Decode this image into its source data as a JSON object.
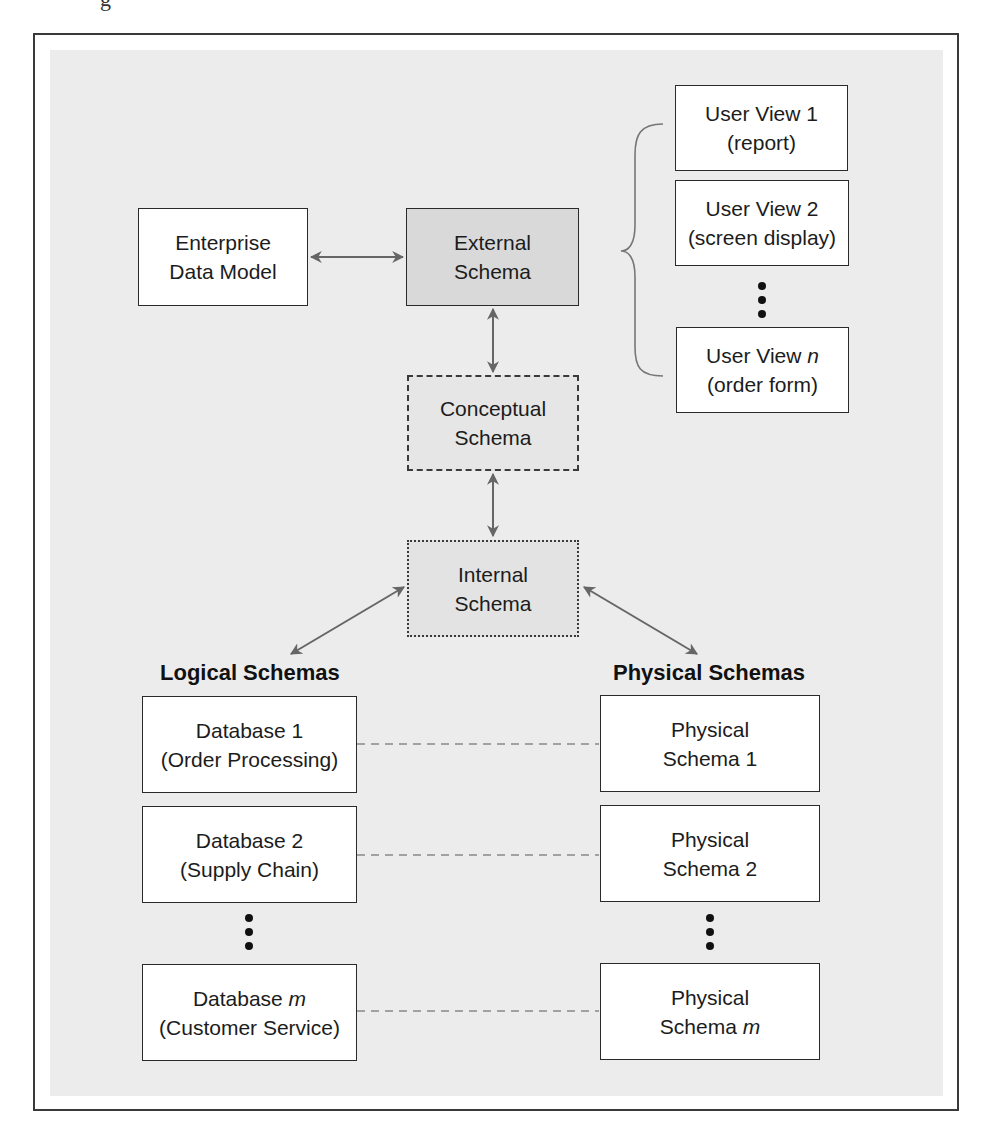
{
  "page_fragment": "g",
  "colors": {
    "frame": "#3a3a3a",
    "panel": "#ececec",
    "box_fill": "#ffffff",
    "external_fill": "#d9d9d9",
    "arrow": "#666666"
  },
  "top": {
    "enterprise": {
      "line1": "Enterprise",
      "line2": "Data Model"
    },
    "external": {
      "line1": "External",
      "line2": "Schema"
    },
    "conceptual": {
      "line1": "Conceptual",
      "line2": "Schema"
    },
    "internal": {
      "line1": "Internal",
      "line2": "Schema"
    }
  },
  "user_views": [
    {
      "line1": "User View 1",
      "line2": "(report)"
    },
    {
      "line1": "User View 2",
      "line2": "(screen display)"
    },
    {
      "line1_prefix": "User View ",
      "line1_var": "n",
      "line2": "(order form)"
    }
  ],
  "logical": {
    "heading": "Logical Schemas",
    "items": [
      {
        "line1": "Database 1",
        "line2": "(Order Processing)"
      },
      {
        "line1": "Database 2",
        "line2": "(Supply Chain)"
      },
      {
        "line1_prefix": "Database ",
        "line1_var": "m",
        "line2": "(Customer Service)"
      }
    ]
  },
  "physical": {
    "heading": "Physical Schemas",
    "items": [
      {
        "line1": "Physical",
        "line2": "Schema 1"
      },
      {
        "line1": "Physical",
        "line2": "Schema 2"
      },
      {
        "line1": "Physical",
        "line2_prefix": "Schema ",
        "line2_var": "m"
      }
    ]
  }
}
